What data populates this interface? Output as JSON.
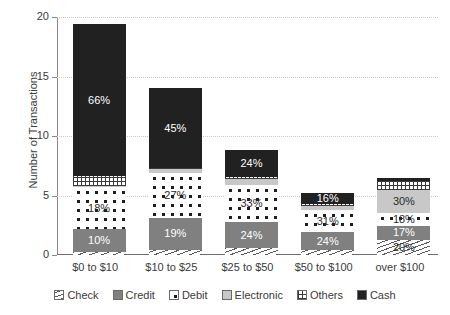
{
  "chart_data": {
    "type": "bar",
    "title": "",
    "xlabel": "",
    "ylabel": "Number of Transactions",
    "ylim": [
      0,
      20
    ],
    "yticks": [
      0,
      5,
      10,
      15,
      20
    ],
    "grid": true,
    "stacked": true,
    "legend_position": "bottom",
    "categories": [
      "$0 to $10",
      "$10 to $25",
      "$25 to $50",
      "$50 to $100",
      "over $100"
    ],
    "series": [
      {
        "name": "Check",
        "pattern": "diagonal-hatch",
        "color": "#5a5a5a",
        "values": [
          0.25,
          0.45,
          0.55,
          0.4,
          1.3
        ],
        "labels": [
          "",
          "",
          "",
          "",
          "20%"
        ]
      },
      {
        "name": "Credit",
        "pattern": "solid-gray",
        "color": "#808080",
        "values": [
          1.95,
          2.65,
          2.25,
          1.5,
          1.1
        ],
        "labels": [
          "10%",
          "19%",
          "24%",
          "24%",
          "17%"
        ]
      },
      {
        "name": "Debit",
        "pattern": "dots",
        "color": "#1e1e1e",
        "values": [
          3.5,
          3.8,
          3.05,
          1.9,
          1.15
        ],
        "labels": [
          "18%",
          "27%",
          "33%",
          "31%",
          "18%"
        ]
      },
      {
        "name": "Electronic",
        "pattern": "solid-lightgray",
        "color": "#c8c8c8",
        "values": [
          0.1,
          0.35,
          0.55,
          0.35,
          1.95
        ],
        "labels": [
          "",
          "",
          "",
          "",
          "30%"
        ]
      },
      {
        "name": "Others",
        "pattern": "grid",
        "color": "#3a3a3a",
        "values": [
          0.8,
          0.1,
          0.15,
          0.1,
          0.7
        ],
        "labels": [
          "",
          "",
          "",
          "",
          ""
        ]
      },
      {
        "name": "Cash",
        "pattern": "solid-black",
        "color": "#212121",
        "values": [
          12.8,
          6.65,
          2.25,
          1.0,
          0.3
        ],
        "labels": [
          "66%",
          "45%",
          "24%",
          "16%",
          ""
        ]
      }
    ],
    "totals": [
      19.4,
      14.0,
      8.8,
      5.25,
      6.5
    ]
  },
  "axis": {
    "y_title": "Number of Transactions",
    "y_tick_labels": [
      "0",
      "5",
      "10",
      "15",
      "20"
    ]
  },
  "legend": {
    "items": [
      {
        "label": "Check"
      },
      {
        "label": "Credit"
      },
      {
        "label": "Debit"
      },
      {
        "label": "Electronic"
      },
      {
        "label": "Others"
      },
      {
        "label": "Cash"
      }
    ]
  }
}
